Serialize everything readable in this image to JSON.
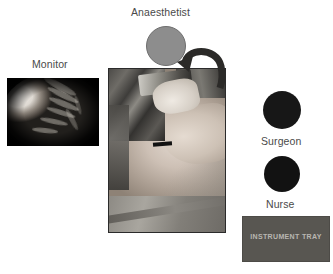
{
  "diagram": {
    "roles": [
      {
        "key": "anaesthetist",
        "label": "Anaesthetist",
        "shape": "circle",
        "color": "#8d8d8d",
        "position": "top-center"
      },
      {
        "key": "surgeon",
        "label": "Surgeon",
        "shape": "circle",
        "color": "#171717",
        "position": "right-upper"
      },
      {
        "key": "nurse",
        "label": "Nurse",
        "shape": "circle",
        "color": "#121212",
        "position": "right-lower"
      }
    ],
    "panels": [
      {
        "key": "monitor",
        "label": "Monitor",
        "caption_position": "above",
        "content": "laparoscopic endoscopic view of tissue",
        "background": "#0a0a0a"
      },
      {
        "key": "patient",
        "label": "",
        "caption_position": "none",
        "content": "photograph of patient draped on operating table with surgical equipment",
        "background": "#9b9b9b"
      }
    ],
    "equipment": [
      {
        "key": "instrument-tray",
        "label": "INSTRUMENT TRAY",
        "shape": "rectangle",
        "color": "#585651",
        "text_color": "#b8b6b1"
      }
    ],
    "annotations": [
      {
        "key": "anaesthetist-arrow",
        "type": "curved-arrow",
        "color": "#2b2a28",
        "points_to": "anaesthetist",
        "points_from": "patient-head-end"
      }
    ],
    "colors": {
      "background": "#ffffff",
      "label_text": "#4a4a4a",
      "anaesthetist_fill": "#8d8d8d",
      "surgeon_fill": "#171717",
      "nurse_fill": "#121212",
      "tray_fill": "#585651",
      "arrow": "#2b2a28"
    }
  }
}
